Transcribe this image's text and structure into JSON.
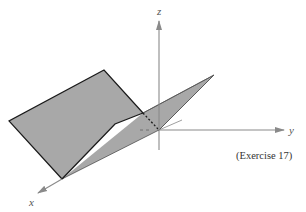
{
  "figure": {
    "caption": "(Exercise 17)",
    "axes": {
      "x_label": "x",
      "y_label": "y",
      "z_label": "z"
    },
    "colors": {
      "plane_fill": "#a8a8a8",
      "edge": "#1a1a1a",
      "axis": "#8a8a8a",
      "background": "#ffffff"
    }
  }
}
